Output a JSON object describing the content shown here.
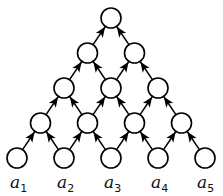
{
  "diagram": {
    "type": "directed-triangular-lattice",
    "colors": {
      "stroke": "#000000",
      "fill": "#ffffff"
    },
    "rows": [
      {
        "level": 4,
        "count": 1
      },
      {
        "level": 3,
        "count": 2
      },
      {
        "level": 2,
        "count": 3
      },
      {
        "level": 1,
        "count": 4
      },
      {
        "level": 0,
        "count": 5
      }
    ],
    "leaf_labels": [
      {
        "base": "a",
        "sub": "1"
      },
      {
        "base": "a",
        "sub": "2"
      },
      {
        "base": "a",
        "sub": "3"
      },
      {
        "base": "a",
        "sub": "4"
      },
      {
        "base": "a",
        "sub": "5"
      }
    ],
    "edge_direction": "upward (child to parent, arrowheads at parent)"
  }
}
